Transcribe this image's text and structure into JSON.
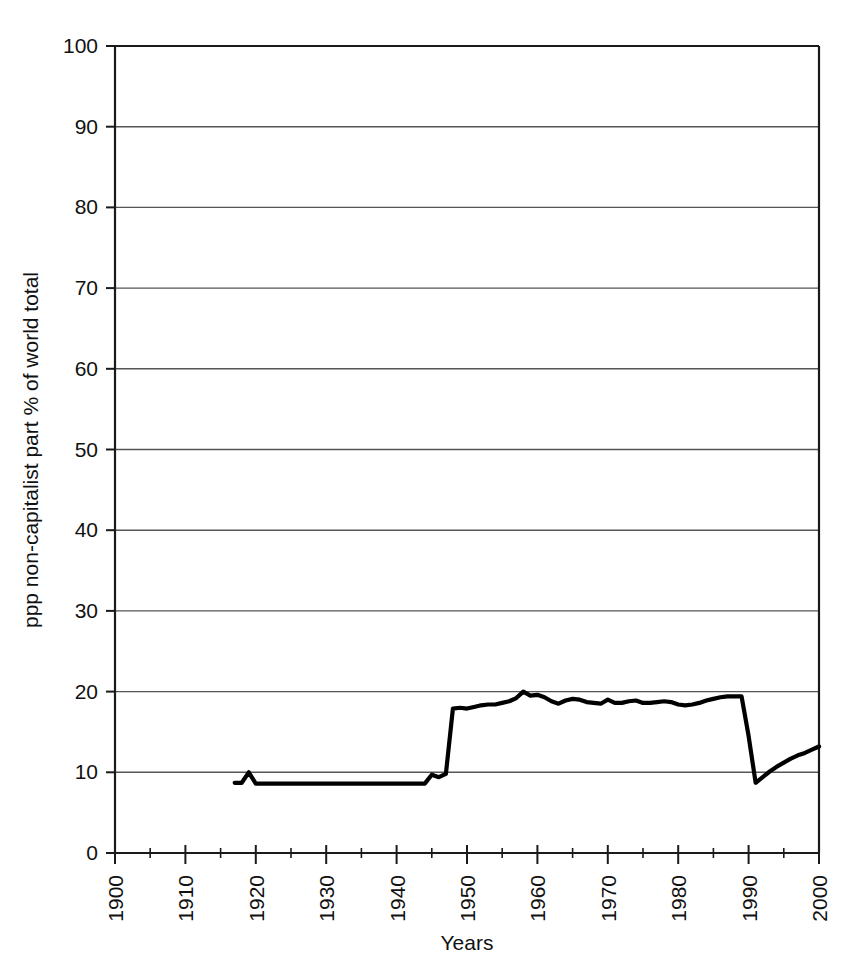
{
  "figure": {
    "background_color": "#ffffff",
    "line_color": "#000000",
    "grid_color": "#555555",
    "axis_color": "#1a1a1a"
  },
  "caption": {
    "text": "Figure 2.   Dynamics of non-capitalist part % of world total"
  },
  "chart_data": {
    "type": "line",
    "title": "",
    "xlabel": "Years",
    "ylabel": "ppp non-capitalist part  % of world total",
    "xlim": [
      1900,
      2000
    ],
    "ylim": [
      0,
      100
    ],
    "grid": true,
    "legend": "none",
    "x_ticks": [
      1900,
      1910,
      1920,
      1930,
      1940,
      1950,
      1960,
      1970,
      1980,
      1990,
      2000
    ],
    "x_tick_labels": [
      "1900",
      "1910",
      "1920",
      "1930",
      "1940",
      "1950",
      "1960",
      "1970",
      "1980",
      "1990",
      "2000"
    ],
    "x_minor_tick_interval": 5,
    "x_tick_label_rotation": -90,
    "y_ticks": [
      0,
      10,
      20,
      30,
      40,
      50,
      60,
      70,
      80,
      90,
      100
    ],
    "y_tick_labels": [
      "0",
      "10",
      "20",
      "30",
      "40",
      "50",
      "60",
      "70",
      "80",
      "90",
      "100"
    ],
    "series": [
      {
        "name": "ppp non-capitalist part % of world total",
        "x": [
          1917,
          1918,
          1919,
          1920,
          1921,
          1925,
          1930,
          1935,
          1940,
          1943,
          1944,
          1945,
          1946,
          1947,
          1948,
          1949,
          1950,
          1951,
          1952,
          1953,
          1954,
          1955,
          1956,
          1957,
          1958,
          1959,
          1960,
          1961,
          1962,
          1963,
          1964,
          1965,
          1966,
          1967,
          1968,
          1969,
          1970,
          1971,
          1972,
          1973,
          1974,
          1975,
          1976,
          1977,
          1978,
          1979,
          1980,
          1981,
          1982,
          1983,
          1984,
          1985,
          1986,
          1987,
          1988,
          1989,
          1990,
          1991,
          1992,
          1993,
          1994,
          1995,
          1996,
          1997,
          1998,
          1999,
          2000
        ],
        "y": [
          8.7,
          8.7,
          10.0,
          8.6,
          8.6,
          8.6,
          8.6,
          8.6,
          8.6,
          8.6,
          8.6,
          9.7,
          9.4,
          9.8,
          17.9,
          18.0,
          17.9,
          18.1,
          18.3,
          18.4,
          18.4,
          18.6,
          18.8,
          19.2,
          20.0,
          19.5,
          19.6,
          19.3,
          18.8,
          18.5,
          18.9,
          19.1,
          19.0,
          18.7,
          18.6,
          18.5,
          19.0,
          18.6,
          18.6,
          18.8,
          18.9,
          18.6,
          18.6,
          18.7,
          18.8,
          18.7,
          18.4,
          18.3,
          18.4,
          18.6,
          18.9,
          19.1,
          19.3,
          19.4,
          19.4,
          19.4,
          14.5,
          8.7,
          9.4,
          10.1,
          10.7,
          11.2,
          11.7,
          12.1,
          12.4,
          12.8,
          13.2
        ]
      }
    ]
  }
}
